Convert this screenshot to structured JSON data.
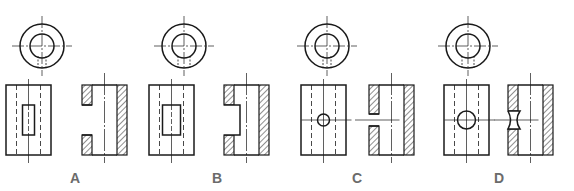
{
  "colors": {
    "line": "#1a1a1a",
    "hatch": "#333333",
    "label": "#6b6b6b",
    "background": "#ffffff"
  },
  "options": [
    {
      "label": "A",
      "hole_type": "rectangular-slot-narrow",
      "description": "Narrow rectangular slot through the front wall"
    },
    {
      "label": "B",
      "hole_type": "rectangular-slot-wide",
      "description": "Wide rectangular slot through the front wall"
    },
    {
      "label": "C",
      "hole_type": "small-round-hole",
      "description": "Small round hole through the front wall"
    },
    {
      "label": "D",
      "hole_type": "large-round-hole",
      "description": "Large round hole through the front wall"
    }
  ]
}
